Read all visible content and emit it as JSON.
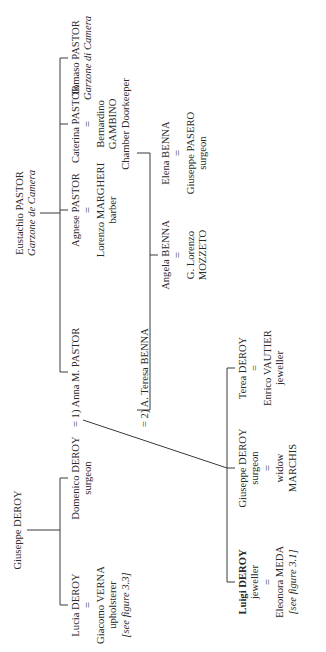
{
  "diagram": {
    "type": "family-tree",
    "orientation": "rotated-90-counterclockwise",
    "roots": {
      "pastor": {
        "name": "Eustachio PASTOR",
        "title": "Garzone de Camera"
      },
      "deroy": {
        "name": "Giuseppe DEROY"
      }
    },
    "pastor_children": [
      {
        "name": "Anna M. PASTOR"
      },
      {
        "name": "Agnese PASTOR",
        "eq": "=",
        "spouse": "Lorenzo MARGHERI",
        "spouse_role": "barber"
      },
      {
        "name": "Caterina PASTOR",
        "eq": "=",
        "spouse": "Bernardino",
        "spouse2": "GAMBINO",
        "spouse_role": "Chamber Doorkeeper"
      },
      {
        "name": "Tomaso PASTOR",
        "title": "Garzone di Camera"
      }
    ],
    "deroy_children": [
      {
        "name": "Lucia DEROY",
        "eq": "=",
        "spouse": "Giacomo VERNA",
        "spouse_role": "upholsterer",
        "ref": "[see figure 3.3]"
      },
      {
        "name": "Domenico DEROY",
        "role": "surgeon",
        "marriage1": "= 1) Anna M. PASTOR",
        "marriage2": "= 2) A. Teresa BENNA"
      }
    ],
    "benna_siblings": [
      {
        "name": "Angela BENNA",
        "eq": "=",
        "spouse": "G. Lorenzo",
        "spouse2": "MOZZETO"
      },
      {
        "name": "Elena BENNA",
        "eq": "=",
        "spouse": "Giuseppe PASERO",
        "spouse_role": "surgeon"
      }
    ],
    "domenico_children": [
      {
        "first": "Luigi",
        "last": "DEROY",
        "role": "jeweller",
        "eq": "=",
        "spouse": "Eleonora MEDA",
        "ref": "[see figure 3.1]"
      },
      {
        "name": "Giuseppe DEROY",
        "role": "surgeon",
        "eq": "=",
        "spouse": "widow",
        "spouse2": "MARCHIS"
      },
      {
        "name": "Terea DEROY",
        "eq": "=",
        "spouse": "Enrico VAUTIER",
        "spouse_role": "jeweller"
      }
    ],
    "marriage_labels": {
      "first": "= 1) Anna M. PASTOR",
      "second": "= 2) A. Teresa BENNA"
    }
  }
}
